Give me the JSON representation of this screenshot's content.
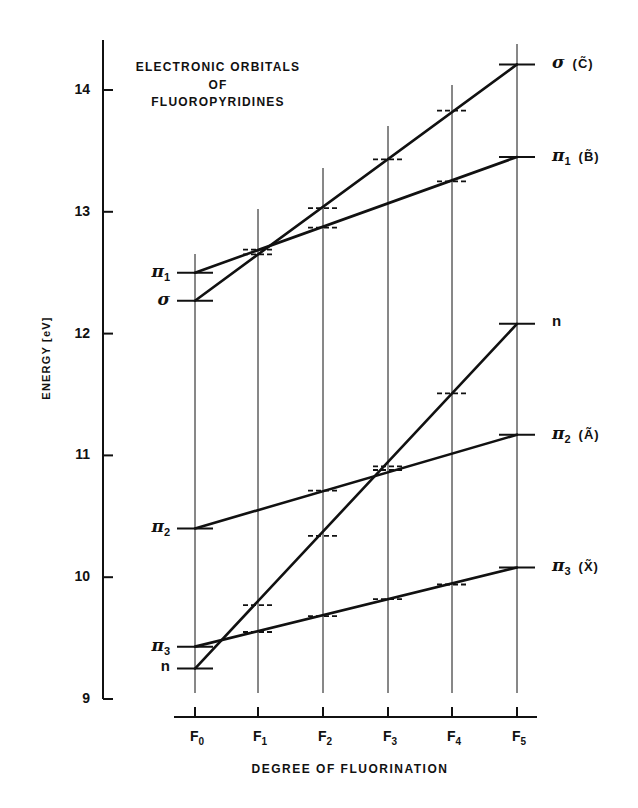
{
  "chart_data": {
    "type": "line",
    "title_lines": [
      "ELECTRONIC ORBITALS",
      "OF",
      "FLUOROPYRIDINES"
    ],
    "xlabel": "DEGREE OF FLUORINATION",
    "ylabel": "ENERGY [eV]",
    "categories": [
      "F0",
      "F1",
      "F2",
      "F3",
      "F4",
      "F5"
    ],
    "category_labels": [
      {
        "main": "F",
        "sub": "0"
      },
      {
        "main": "F",
        "sub": "1"
      },
      {
        "main": "F",
        "sub": "2"
      },
      {
        "main": "F",
        "sub": "3"
      },
      {
        "main": "F",
        "sub": "4"
      },
      {
        "main": "F",
        "sub": "5"
      }
    ],
    "ylim": [
      9,
      14.4
    ],
    "yticks": [
      9,
      10,
      11,
      12,
      13,
      14
    ],
    "grid": "vertical lines at each category",
    "legend": "inline labels at line endpoints",
    "series": [
      {
        "name": "σ (C̃)",
        "left_label": {
          "sym": "σ",
          "sub": ""
        },
        "right_label": {
          "sym": "σ",
          "sub": "",
          "state": "(C̃)"
        },
        "endpoints": [
          12.27,
          14.21
        ],
        "values": [
          12.27,
          12.65,
          13.03,
          13.43,
          13.83,
          14.21
        ],
        "marks": [
          true,
          true,
          true,
          true,
          true,
          true
        ]
      },
      {
        "name": "π1 (B̃)",
        "left_label": {
          "sym": "π",
          "sub": "1"
        },
        "right_label": {
          "sym": "π",
          "sub": "1",
          "state": "(B̃)"
        },
        "endpoints": [
          12.5,
          13.45
        ],
        "values": [
          12.5,
          12.69,
          12.87,
          null,
          13.25,
          13.45
        ],
        "marks": [
          true,
          true,
          true,
          false,
          true,
          true
        ]
      },
      {
        "name": "n",
        "left_label": {
          "sym": "n",
          "sub": ""
        },
        "right_label": {
          "sym": "n",
          "sub": "",
          "state": ""
        },
        "endpoints": [
          9.25,
          12.08
        ],
        "values": [
          9.25,
          9.77,
          10.34,
          10.91,
          11.51,
          12.08
        ],
        "marks": [
          true,
          true,
          true,
          true,
          true,
          true
        ]
      },
      {
        "name": "π2 (Ã)",
        "left_label": {
          "sym": "π",
          "sub": "2"
        },
        "right_label": {
          "sym": "π",
          "sub": "2",
          "state": "(Ã)"
        },
        "endpoints": [
          10.4,
          11.17
        ],
        "values": [
          10.4,
          null,
          10.71,
          10.88,
          null,
          11.17
        ],
        "marks": [
          true,
          false,
          true,
          true,
          false,
          true
        ]
      },
      {
        "name": "π3 (X̃)",
        "left_label": {
          "sym": "π",
          "sub": "3"
        },
        "right_label": {
          "sym": "π",
          "sub": "3",
          "state": "(X̃)"
        },
        "endpoints": [
          9.43,
          10.08
        ],
        "values": [
          9.43,
          9.55,
          9.68,
          9.82,
          9.94,
          10.08
        ],
        "marks": [
          true,
          true,
          true,
          true,
          true,
          true
        ]
      }
    ]
  },
  "colors": {
    "ink": "#111111",
    "background": "#ffffff"
  }
}
